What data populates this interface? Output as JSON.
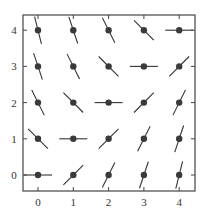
{
  "chart_data": {
    "type": "scatter",
    "subtype": "slope-field",
    "title": "",
    "xlabel": "",
    "ylabel": "",
    "xlim": [
      -0.4,
      4.45
    ],
    "ylim": [
      -0.45,
      4.4
    ],
    "xticks": [
      "0",
      "1",
      "2",
      "3",
      "4"
    ],
    "yticks": [
      "0",
      "1",
      "2",
      "3",
      "4"
    ],
    "grid": false,
    "legend": null,
    "equation": "dy/dx = x - y",
    "points": [
      {
        "x": 0,
        "y": 0,
        "slope": 0
      },
      {
        "x": 1,
        "y": 0,
        "slope": 1
      },
      {
        "x": 2,
        "y": 0,
        "slope": 2
      },
      {
        "x": 3,
        "y": 0,
        "slope": 3
      },
      {
        "x": 4,
        "y": 0,
        "slope": 4
      },
      {
        "x": 0,
        "y": 1,
        "slope": -1
      },
      {
        "x": 1,
        "y": 1,
        "slope": 0
      },
      {
        "x": 2,
        "y": 1,
        "slope": 1
      },
      {
        "x": 3,
        "y": 1,
        "slope": 2
      },
      {
        "x": 4,
        "y": 1,
        "slope": 3
      },
      {
        "x": 0,
        "y": 2,
        "slope": -2
      },
      {
        "x": 1,
        "y": 2,
        "slope": -1
      },
      {
        "x": 2,
        "y": 2,
        "slope": 0
      },
      {
        "x": 3,
        "y": 2,
        "slope": 1
      },
      {
        "x": 4,
        "y": 2,
        "slope": 2
      },
      {
        "x": 0,
        "y": 3,
        "slope": -3
      },
      {
        "x": 1,
        "y": 3,
        "slope": -2
      },
      {
        "x": 2,
        "y": 3,
        "slope": -1
      },
      {
        "x": 3,
        "y": 3,
        "slope": 0
      },
      {
        "x": 4,
        "y": 3,
        "slope": 1
      },
      {
        "x": 0,
        "y": 4,
        "slope": -4
      },
      {
        "x": 1,
        "y": 4,
        "slope": -3
      },
      {
        "x": 2,
        "y": 4,
        "slope": -2
      },
      {
        "x": 3,
        "y": 4,
        "slope": -1
      },
      {
        "x": 4,
        "y": 4,
        "slope": 0
      }
    ]
  },
  "style": {
    "axis_color": "#444444",
    "segment_color": "#333333",
    "dot_color": "#3a3a3a"
  }
}
